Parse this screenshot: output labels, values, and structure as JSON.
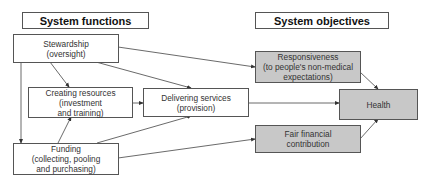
{
  "headers": {
    "functions": "System functions",
    "objectives": "System objectives"
  },
  "functions": {
    "stewardship": {
      "line1": "Stewardship",
      "line2": "(oversight)"
    },
    "creating_resources": {
      "line1": "Creating resources",
      "line2": "(investment",
      "line3": "and training)"
    },
    "delivering_services": {
      "line1": "Delivering services",
      "line2": "(provision)"
    },
    "funding": {
      "line1": "Funding",
      "line2": "(collecting, pooling",
      "line3": "and purchasing)"
    }
  },
  "objectives": {
    "responsiveness": {
      "line1": "Responsiveness",
      "line2": "(to people's non-medical",
      "line3": "expectations)"
    },
    "health": {
      "line1": "Health"
    },
    "fair_financial": {
      "line1": "Fair financial",
      "line2": "contribution"
    }
  },
  "colors": {
    "objective_fill": "#c8c8c8",
    "function_fill": "#ffffff",
    "border": "#555555"
  },
  "edges": [
    [
      "stewardship",
      "creating_resources"
    ],
    [
      "stewardship",
      "delivering_services"
    ],
    [
      "stewardship",
      "responsiveness"
    ],
    [
      "stewardship",
      "funding"
    ],
    [
      "creating_resources",
      "delivering_services"
    ],
    [
      "funding",
      "creating_resources"
    ],
    [
      "funding",
      "delivering_services"
    ],
    [
      "funding",
      "fair_financial"
    ],
    [
      "delivering_services",
      "health"
    ],
    [
      "responsiveness",
      "health"
    ],
    [
      "fair_financial",
      "health"
    ]
  ]
}
